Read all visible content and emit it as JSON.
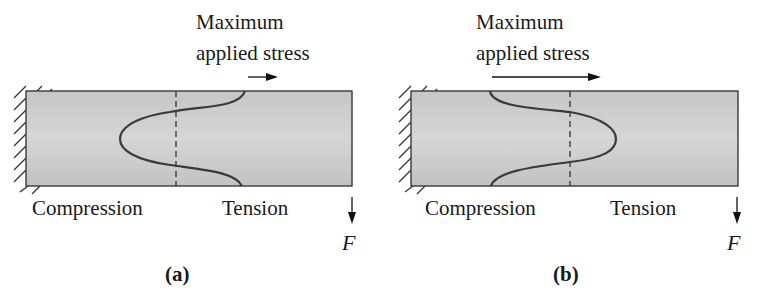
{
  "figure": {
    "panels": [
      {
        "id": "a",
        "caption": "(a)",
        "title_line1": "Maximum",
        "title_line2": "applied stress",
        "left_label": "Compression",
        "right_label": "Tension",
        "force_label": "F",
        "stress_peak_side": "compression"
      },
      {
        "id": "b",
        "caption": "(b)",
        "title_line1": "Maximum",
        "title_line2": "applied stress",
        "left_label": "Compression",
        "right_label": "Tension",
        "force_label": "F",
        "stress_peak_side": "tension"
      }
    ],
    "colors": {
      "beam_fill_top": "#c8c8c8",
      "beam_fill_bottom": "#dcdcdc",
      "line": "#3a3a3a",
      "text": "#1a1a1a"
    }
  }
}
